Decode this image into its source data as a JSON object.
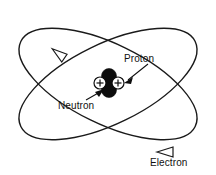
{
  "diagram": {
    "type": "atomic-model",
    "background_color": "#ffffff",
    "stroke_color": "#1a1a1a",
    "labels": {
      "proton": "Proton",
      "neutron": "Neutron",
      "electron": "Electron"
    },
    "nucleus": {
      "proton_symbol": "+",
      "proton_count": 2,
      "neutron_count": 2,
      "proton_fill": "#ffffff",
      "neutron_fill": "#0d0d0d"
    },
    "orbits": {
      "count": 2,
      "direction_markers": 2,
      "marker_style": "open-triangle-arrowhead"
    }
  }
}
